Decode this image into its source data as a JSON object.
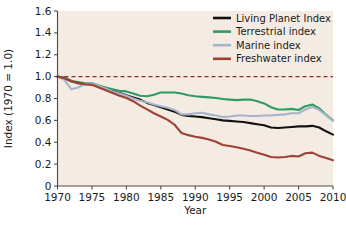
{
  "chart_data": {
    "type": "line",
    "title": "",
    "xlabel": "Year",
    "ylabel": "Index (1970 = 1.0)",
    "xlim": [
      1970,
      2010
    ],
    "ylim": [
      0,
      1.6
    ],
    "xticks": [
      1970,
      1975,
      1980,
      1985,
      1990,
      1995,
      2000,
      2005,
      2010
    ],
    "xtick_labels": [
      "1970",
      "1975",
      "1980",
      "1985",
      "1990",
      "1995",
      "2000",
      "2005",
      "2010"
    ],
    "yticks": [
      0,
      0.2,
      0.4,
      0.6,
      0.8,
      1.0,
      1.2,
      1.4,
      1.6
    ],
    "ytick_labels": [
      "0",
      "0.2",
      "0.4",
      "0.6",
      "0.8",
      "1.0",
      "1.2",
      "1.4",
      "1.6"
    ],
    "grid": false,
    "legend_position": "top-right",
    "reference_line": {
      "name": "baseline-1970",
      "value": 1.0,
      "style": "dashed",
      "color": "#8c2f23"
    },
    "x": [
      1970,
      1971,
      1972,
      1973,
      1974,
      1975,
      1976,
      1977,
      1978,
      1979,
      1980,
      1981,
      1982,
      1983,
      1984,
      1985,
      1986,
      1987,
      1988,
      1989,
      1990,
      1991,
      1992,
      1993,
      1994,
      1995,
      1996,
      1997,
      1998,
      1999,
      2000,
      2001,
      2002,
      2003,
      2004,
      2005,
      2006,
      2007,
      2008,
      2009,
      2010
    ],
    "series": [
      {
        "name": "Living Planet Index",
        "color": "#111111",
        "values": [
          1.0,
          0.99,
          0.96,
          0.94,
          0.93,
          0.93,
          0.91,
          0.89,
          0.87,
          0.85,
          0.83,
          0.81,
          0.79,
          0.76,
          0.74,
          0.72,
          0.7,
          0.68,
          0.65,
          0.64,
          0.635,
          0.63,
          0.62,
          0.61,
          0.6,
          0.595,
          0.59,
          0.585,
          0.575,
          0.565,
          0.555,
          0.535,
          0.53,
          0.535,
          0.54,
          0.545,
          0.545,
          0.55,
          0.535,
          0.5,
          0.47
        ]
      },
      {
        "name": "Terrestrial index",
        "color": "#2e9b63",
        "values": [
          1.0,
          0.99,
          0.96,
          0.95,
          0.94,
          0.94,
          0.92,
          0.9,
          0.885,
          0.87,
          0.865,
          0.845,
          0.825,
          0.82,
          0.835,
          0.855,
          0.855,
          0.855,
          0.845,
          0.83,
          0.82,
          0.815,
          0.81,
          0.805,
          0.795,
          0.79,
          0.785,
          0.79,
          0.79,
          0.775,
          0.755,
          0.72,
          0.7,
          0.7,
          0.705,
          0.695,
          0.73,
          0.745,
          0.71,
          0.65,
          0.6
        ]
      },
      {
        "name": "Marine index",
        "color": "#a9b3cc",
        "values": [
          1.0,
          0.97,
          0.885,
          0.9,
          0.935,
          0.935,
          0.915,
          0.89,
          0.865,
          0.845,
          0.825,
          0.8,
          0.78,
          0.765,
          0.745,
          0.73,
          0.715,
          0.695,
          0.655,
          0.655,
          0.665,
          0.67,
          0.655,
          0.645,
          0.63,
          0.635,
          0.645,
          0.645,
          0.64,
          0.64,
          0.645,
          0.645,
          0.65,
          0.655,
          0.665,
          0.665,
          0.7,
          0.725,
          0.695,
          0.645,
          0.595
        ]
      },
      {
        "name": "Freshwater index",
        "color": "#9e4134",
        "values": [
          1.0,
          0.985,
          0.955,
          0.945,
          0.93,
          0.925,
          0.9,
          0.875,
          0.85,
          0.825,
          0.805,
          0.775,
          0.735,
          0.7,
          0.665,
          0.635,
          0.605,
          0.56,
          0.485,
          0.465,
          0.45,
          0.44,
          0.425,
          0.405,
          0.375,
          0.365,
          0.355,
          0.34,
          0.325,
          0.305,
          0.285,
          0.265,
          0.26,
          0.265,
          0.275,
          0.27,
          0.3,
          0.305,
          0.275,
          0.255,
          0.235
        ]
      }
    ]
  },
  "legend": {
    "items": [
      {
        "label": "Living Planet Index",
        "color": "#111111"
      },
      {
        "label": "Terrestrial index",
        "color": "#2e9b63"
      },
      {
        "label": "Marine index",
        "color": "#a9b3cc"
      },
      {
        "label": "Freshwater index",
        "color": "#9e4134"
      }
    ]
  },
  "colors": {
    "plot_background": "#f4ece2",
    "page_background": "#ffffff",
    "axis": "#4a4a46",
    "text": "#1a1a1a"
  }
}
